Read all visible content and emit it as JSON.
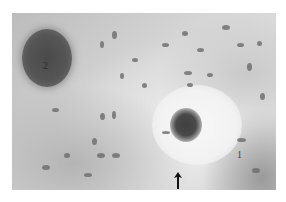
{
  "figure": {
    "labels": [
      {
        "id": "2",
        "text": "2",
        "target": "large dark vessel lumen (upper left)"
      },
      {
        "id": "1",
        "text": "1",
        "target": "pale tissue region (lower right)"
      }
    ],
    "arrow": {
      "direction": "up",
      "target": "cell near lower edge below small vessel"
    },
    "colors": {
      "background": "#d4d4d4",
      "dark_lumen": "#4a4a4a",
      "nuclei": "#6a6a6a",
      "pale_region": "#f2f2f2"
    }
  }
}
